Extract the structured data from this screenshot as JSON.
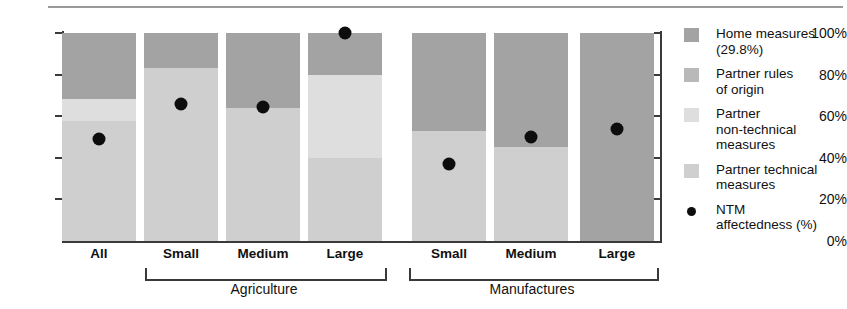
{
  "chart_data": {
    "type": "bar",
    "subtype": "stacked-bar-with-scatter-overlay",
    "title": "",
    "xlabel": "",
    "ylabel": "",
    "ylim": [
      0,
      100
    ],
    "ytick_labels": [
      "0%",
      "20%",
      "40%",
      "60%",
      "80%",
      "100%"
    ],
    "ytick_values": [
      0,
      20,
      40,
      60,
      80,
      100
    ],
    "grid": false,
    "legend_position": "right",
    "categories": [
      "All",
      "Small",
      "Medium",
      "Large",
      "Small",
      "Medium",
      "Large"
    ],
    "groups": [
      {
        "label": "Agriculture",
        "categories": [
          "Small",
          "Medium",
          "Large"
        ]
      },
      {
        "label": "Manufactures",
        "categories": [
          "Small",
          "Medium",
          "Large"
        ]
      }
    ],
    "series": [
      {
        "name": "Home measures",
        "color": "#a3a3a3",
        "values": [
          31.5,
          17.0,
          36.0,
          20.0,
          47.0,
          55.0,
          100.0
        ]
      },
      {
        "name": "Partner rules of origin",
        "color": "#b9b9b9",
        "values": [
          0.0,
          0.0,
          0.0,
          0.0,
          0.0,
          0.0,
          0.0
        ]
      },
      {
        "name": "Partner non-technical measures",
        "color": "#dedede",
        "values": [
          11.0,
          0.0,
          0.0,
          40.0,
          0.0,
          0.0,
          0.0
        ]
      },
      {
        "name": "Partner technical measures",
        "color": "#cfcfcf",
        "values": [
          57.5,
          83.0,
          64.0,
          40.0,
          53.0,
          45.0,
          0.0
        ]
      }
    ],
    "overlay": {
      "name": "NTM affectedness (%)",
      "marker": "filled-circle",
      "color": "#0d0d0d",
      "values": [
        49.0,
        66.0,
        64.5,
        100.0,
        37.0,
        50.0,
        54.0
      ]
    }
  },
  "legend": {
    "items": [
      {
        "label": "Home measures\n(29.8%)",
        "swatch": "#a3a3a3",
        "marker": "square"
      },
      {
        "label": "Partner rules\nof origin",
        "swatch": "#b9b9b9",
        "marker": "square"
      },
      {
        "label": "Partner\nnon-technical\nmeasures",
        "swatch": "#dedede",
        "marker": "square"
      },
      {
        "label": "Partner technical\nmeasures",
        "swatch": "#cfcfcf",
        "marker": "square"
      },
      {
        "label": "NTM\naffectedness (%)",
        "swatch": "",
        "marker": "circle"
      }
    ]
  },
  "axis": {
    "y": {
      "t0": "0%",
      "t1": "20%",
      "t2": "40%",
      "t3": "60%",
      "t4": "80%",
      "t5": "100%"
    },
    "x": {
      "c0": "All",
      "c1": "Small",
      "c2": "Medium",
      "c3": "Large",
      "c4": "Small",
      "c5": "Medium",
      "c6": "Large",
      "g0": "Agriculture",
      "g1": "Manufactures"
    }
  }
}
